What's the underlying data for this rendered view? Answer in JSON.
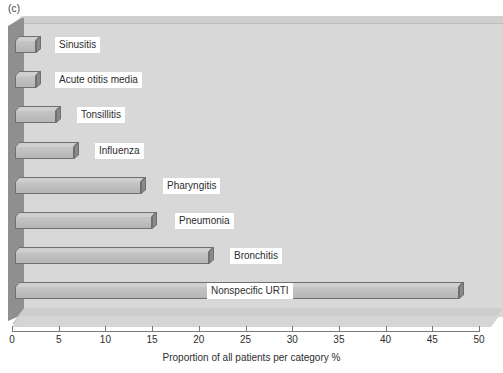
{
  "figure": {
    "panel_label": "(c)",
    "background_color": "#ffffff",
    "plot_area_color": "#d8d8d8",
    "bar_face_color": "#bcbcbc",
    "bar_edge_color": "#6f6f6f",
    "bar_side_color": "#8a8a8a",
    "bar_top_color": "#cfcfcf",
    "left_wall_color": "#8f8f8f"
  },
  "chart_data": {
    "type": "bar",
    "orientation": "horizontal",
    "title": "",
    "subtitle": "",
    "xlabel": "Proportion of all patients per category %",
    "ylabel": "",
    "xlim": [
      0,
      50
    ],
    "xticks": [
      0,
      5,
      10,
      15,
      20,
      25,
      30,
      35,
      40,
      45,
      50
    ],
    "xtick_labels": [
      "0",
      "5",
      "10",
      "15",
      "20",
      "25",
      "30",
      "35",
      "40",
      "45",
      "50"
    ],
    "grid": false,
    "legend": null,
    "legend_position": "none",
    "categories": [
      "Sinusitis",
      "Acute otitis media",
      "Tonsillitis",
      "Influenza",
      "Pharyngitis",
      "Pneumonia",
      "Bronchitis",
      "Nonspecific URTI"
    ],
    "values": [
      2.3,
      2.3,
      4.4,
      6.3,
      13.5,
      14.7,
      20.8,
      47.5
    ],
    "annotations": [
      "(c)"
    ]
  },
  "labels": {
    "offsets_px": [
      40,
      40,
      62,
      80,
      148,
      160,
      215,
      192
    ]
  }
}
